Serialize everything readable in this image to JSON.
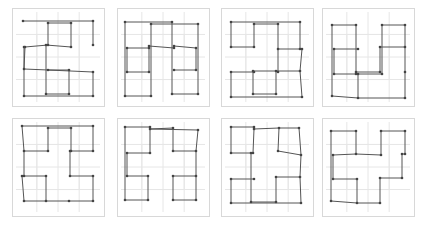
{
  "figure": {
    "layout": {
      "rows": 2,
      "cols": 4
    },
    "colors": {
      "frame": "#d8d8d8",
      "grid": "#e6e6e6",
      "line": "#555555",
      "vertex": "#444444"
    },
    "panels": [
      {
        "id": 1,
        "x": 12,
        "y": 8,
        "w": 92,
        "h": 98,
        "segments": [
          [
            [
              23,
              21
            ],
            [
              93,
              21
            ],
            [
              93,
              45
            ]
          ],
          [
            [
              48,
              23
            ],
            [
              71,
              23
            ],
            [
              71,
              47
            ]
          ],
          [
            [
              48,
              23
            ],
            [
              48,
              45
            ],
            [
              25,
              47
            ],
            [
              24,
              69
            ]
          ],
          [
            [
              24,
              47
            ],
            [
              24,
              69
            ],
            [
              48,
              70
            ],
            [
              69,
              70
            ],
            [
              69,
              94
            ]
          ],
          [
            [
              46,
              45
            ],
            [
              71,
              47
            ]
          ],
          [
            [
              46,
              45
            ],
            [
              46,
              94
            ],
            [
              69,
              94
            ]
          ],
          [
            [
              24,
              69
            ],
            [
              24,
              96
            ],
            [
              93,
              96
            ],
            [
              93,
              72
            ],
            [
              48,
              70
            ]
          ]
        ]
      },
      {
        "id": 2,
        "x": 117,
        "y": 8,
        "w": 92,
        "h": 98,
        "segments": [
          [
            [
              125,
              22
            ],
            [
              172,
              22
            ],
            [
              172,
              94
            ],
            [
              198,
              94
            ],
            [
              198,
              24
            ],
            [
              151,
              24
            ],
            [
              151,
              96
            ],
            [
              125,
              96
            ],
            [
              125,
              22
            ]
          ],
          [
            [
              127,
              48
            ],
            [
              149,
              48
            ],
            [
              149,
              72
            ],
            [
              127,
              72
            ],
            [
              127,
              48
            ]
          ],
          [
            [
              149,
              46
            ],
            [
              174,
              48
            ]
          ],
          [
            [
              174,
              46
            ],
            [
              196,
              48
            ],
            [
              196,
              70
            ],
            [
              174,
              70
            ]
          ]
        ]
      },
      {
        "id": 3,
        "x": 221,
        "y": 8,
        "w": 92,
        "h": 98,
        "segments": [
          [
            [
              231,
              22
            ],
            [
              300,
              22
            ],
            [
              300,
              49
            ],
            [
              302,
              49
            ],
            [
              300,
              71
            ],
            [
              276,
              71
            ],
            [
              276,
              94
            ],
            [
              253,
              94
            ],
            [
              253,
              71
            ],
            [
              276,
              71
            ]
          ],
          [
            [
              231,
              22
            ],
            [
              231,
              47
            ],
            [
              254,
              47
            ],
            [
              254,
              24
            ],
            [
              278,
              24
            ],
            [
              278,
              49
            ],
            [
              300,
              49
            ]
          ],
          [
            [
              278,
              49
            ],
            [
              278,
              72
            ]
          ],
          [
            [
              231,
              72
            ],
            [
              254,
              72
            ]
          ],
          [
            [
              231,
              72
            ],
            [
              231,
              97
            ],
            [
              302,
              97
            ],
            [
              300,
              71
            ]
          ]
        ]
      },
      {
        "id": 4,
        "x": 322,
        "y": 8,
        "w": 92,
        "h": 98,
        "segments": [
          [
            [
              332,
              25
            ],
            [
              356,
              25
            ],
            [
              356,
              72
            ],
            [
              380,
              72
            ],
            [
              380,
              47
            ],
            [
              405,
              47
            ],
            [
              405,
              72
            ]
          ],
          [
            [
              334,
              49
            ],
            [
              358,
              49
            ]
          ],
          [
            [
              334,
              49
            ],
            [
              334,
              74
            ],
            [
              356,
              74
            ]
          ],
          [
            [
              382,
              25
            ],
            [
              405,
              25
            ],
            [
              405,
              47
            ]
          ],
          [
            [
              382,
              25
            ],
            [
              382,
              74
            ],
            [
              358,
              74
            ],
            [
              358,
              98
            ],
            [
              405,
              98
            ],
            [
              405,
              72
            ]
          ],
          [
            [
              332,
              25
            ],
            [
              332,
              96
            ],
            [
              358,
              98
            ]
          ]
        ]
      },
      {
        "id": 5,
        "x": 12,
        "y": 118,
        "w": 92,
        "h": 98,
        "segments": [
          [
            [
              22,
              126
            ],
            [
              93,
              126
            ],
            [
              93,
              151
            ],
            [
              70,
              151
            ],
            [
              70,
              176
            ],
            [
              93,
              176
            ],
            [
              93,
              201
            ],
            [
              69,
              201
            ],
            [
              46,
              201
            ],
            [
              46,
              176
            ],
            [
              24,
              176
            ],
            [
              24,
              151
            ],
            [
              48,
              151
            ],
            [
              48,
              128
            ],
            [
              71,
              128
            ],
            [
              71,
              151
            ]
          ],
          [
            [
              24,
              151
            ],
            [
              22,
              126
            ]
          ],
          [
            [
              22,
              176
            ],
            [
              24,
              201
            ],
            [
              46,
              201
            ]
          ]
        ]
      },
      {
        "id": 6,
        "x": 117,
        "y": 118,
        "w": 92,
        "h": 98,
        "segments": [
          [
            [
              125,
              127
            ],
            [
              150,
              127
            ],
            [
              150,
              129
            ],
            [
              173,
              128
            ],
            [
              173,
              151
            ],
            [
              196,
              151
            ],
            [
              196,
              176
            ],
            [
              173,
              176
            ],
            [
              173,
              200
            ],
            [
              196,
              200
            ],
            [
              196,
              176
            ]
          ],
          [
            [
              196,
              151
            ],
            [
              198,
              130
            ],
            [
              150,
              129
            ]
          ],
          [
            [
              125,
              127
            ],
            [
              125,
              200
            ],
            [
              148,
              200
            ],
            [
              148,
              176
            ],
            [
              127,
              176
            ],
            [
              127,
              153
            ],
            [
              150,
              153
            ],
            [
              150,
              129
            ]
          ]
        ]
      },
      {
        "id": 7,
        "x": 221,
        "y": 118,
        "w": 92,
        "h": 98,
        "segments": [
          [
            [
              231,
              127
            ],
            [
              254,
              127
            ],
            [
              254,
              129
            ],
            [
              279,
              128
            ],
            [
              278,
              151
            ],
            [
              301,
              155
            ],
            [
              300,
              177
            ],
            [
              276,
              177
            ],
            [
              276,
              202
            ],
            [
              251,
              202
            ],
            [
              251,
              153
            ],
            [
              253,
              153
            ],
            [
              254,
              129
            ]
          ],
          [
            [
              231,
              127
            ],
            [
              231,
              153
            ],
            [
              251,
              153
            ]
          ],
          [
            [
              301,
              155
            ],
            [
              299,
              128
            ],
            [
              279,
              128
            ]
          ],
          [
            [
              231,
              179
            ],
            [
              254,
              179
            ]
          ],
          [
            [
              231,
              179
            ],
            [
              231,
              203
            ],
            [
              301,
              203
            ],
            [
              300,
              177
            ]
          ]
        ]
      },
      {
        "id": 8,
        "x": 322,
        "y": 118,
        "w": 92,
        "h": 98,
        "segments": [
          [
            [
              331,
              131
            ],
            [
              356,
              131
            ],
            [
              356,
              154
            ],
            [
              381,
              155
            ],
            [
              381,
              131
            ],
            [
              405,
              131
            ],
            [
              405,
              154
            ],
            [
              402,
              154
            ]
          ],
          [
            [
              333,
              155
            ],
            [
              356,
              154
            ]
          ],
          [
            [
              333,
              155
            ],
            [
              333,
              179
            ],
            [
              357,
              179
            ],
            [
              357,
              203
            ],
            [
              380,
              203
            ],
            [
              380,
              178
            ],
            [
              402,
              178
            ],
            [
              402,
              154
            ]
          ],
          [
            [
              331,
              131
            ],
            [
              331,
              201
            ],
            [
              357,
              203
            ]
          ]
        ]
      }
    ]
  }
}
